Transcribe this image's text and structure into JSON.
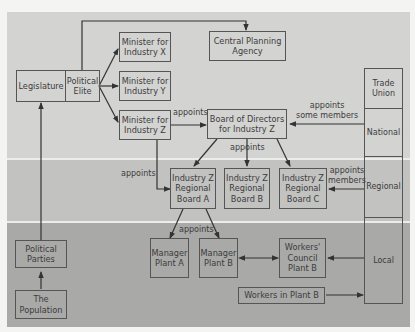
{
  "bands": [
    {
      "name": "National",
      "color": "#d3d3d2"
    },
    {
      "name": "Regional",
      "color": "#c2c2c1"
    },
    {
      "name": "Local",
      "color": "#a9a9a8"
    }
  ],
  "nodes": {
    "legislature": "Legislature",
    "political_elite": "Political\nElite",
    "central_planning": "Central Planning\nAgency",
    "minister_x": "Minister for\nIndustry X",
    "minister_y": "Minister for\nIndustry Y",
    "minister_z": "Minister for\nIndustry Z",
    "board_directors": "Board of Directors\nfor Industry Z",
    "regional_a": "Industry Z\nRegional\nBoard A",
    "regional_b": "Industry Z\nRegional\nBoard B",
    "regional_c": "Industry Z\nRegional\nBoard C",
    "manager_a": "Manager\nPlant A",
    "manager_b": "Manager\nPlant B",
    "workers_council": "Workers'\nCouncil\nPlant B",
    "workers_plant": "Workers in Plant B",
    "political_parties": "Political\nParties",
    "population": "The\nPopulation"
  },
  "trade_union": {
    "title": "Trade\nUnion",
    "national": "National",
    "regional": "Regional",
    "local": "Local"
  },
  "edge_labels": {
    "minister_to_board": "appoints",
    "union_to_board": "appoints\nsome members",
    "board_to_regional": "appoints",
    "minister_to_regional_a": "appoints",
    "union_to_regional_c": "appoints\nmembers",
    "regional_a_to_managers": "appoints"
  }
}
